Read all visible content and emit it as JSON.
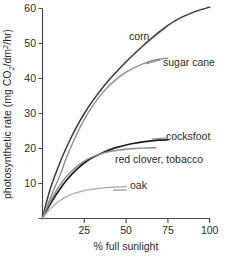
{
  "chart_data": {
    "type": "line",
    "title": "",
    "xlabel": "% full sunlight",
    "ylabel": "photosynthetic rate (mg CO2/dm2/hr)",
    "ylabel_parts": {
      "before": "photosynthetic rate (mg CO",
      "sub1": "2",
      "mid": "/dm",
      "sup1": "2",
      "after": "/hr)"
    },
    "xlim": [
      0,
      100
    ],
    "ylim": [
      0,
      60
    ],
    "xticks": [
      25,
      50,
      75,
      100
    ],
    "xtick_labels": [
      "25",
      "50",
      "75",
      "100"
    ],
    "yticks": [
      10,
      20,
      30,
      40,
      50,
      60
    ],
    "ytick_labels": [
      "10",
      "20",
      "30",
      "40",
      "50",
      "60"
    ],
    "grid": false,
    "legend_position": "inline-annotations",
    "series": [
      {
        "name": "corn",
        "label": "corn",
        "color": "#3a3a3a",
        "width": 1.5,
        "points": [
          [
            0,
            0
          ],
          [
            2,
            4.0
          ],
          [
            5,
            9.0
          ],
          [
            8,
            13.0
          ],
          [
            12,
            17.8
          ],
          [
            16,
            22.0
          ],
          [
            20,
            25.8
          ],
          [
            25,
            30.0
          ],
          [
            30,
            33.6
          ],
          [
            35,
            36.8
          ],
          [
            40,
            39.7
          ],
          [
            45,
            42.3
          ],
          [
            50,
            44.8
          ],
          [
            55,
            47.1
          ],
          [
            60,
            49.3
          ],
          [
            65,
            51.4
          ],
          [
            70,
            53.4
          ],
          [
            75,
            55.2
          ],
          [
            80,
            56.7
          ],
          [
            85,
            57.9
          ],
          [
            90,
            58.9
          ],
          [
            95,
            59.7
          ],
          [
            100,
            60.4
          ]
        ]
      },
      {
        "name": "sugar-cane",
        "label": "sugar cane",
        "color": "#8f8f8f",
        "width": 1.4,
        "points": [
          [
            0,
            0
          ],
          [
            2,
            2.6
          ],
          [
            5,
            6.2
          ],
          [
            8,
            9.6
          ],
          [
            11,
            13.0
          ],
          [
            14,
            17.0
          ],
          [
            18,
            21.5
          ],
          [
            22,
            25.6
          ],
          [
            26,
            29.2
          ],
          [
            30,
            32.2
          ],
          [
            35,
            35.4
          ],
          [
            40,
            38.0
          ],
          [
            45,
            40.1
          ],
          [
            50,
            41.8
          ],
          [
            55,
            43.1
          ],
          [
            60,
            44.2
          ],
          [
            65,
            45.0
          ],
          [
            70,
            45.5
          ],
          [
            75,
            45.8
          ]
        ]
      },
      {
        "name": "cocksfoot",
        "label": "cocksfoot",
        "color": "#1e1e1e",
        "width": 1.7,
        "points": [
          [
            0,
            0
          ],
          [
            2,
            1.9
          ],
          [
            5,
            4.4
          ],
          [
            8,
            6.7
          ],
          [
            11,
            8.8
          ],
          [
            14,
            10.7
          ],
          [
            18,
            12.9
          ],
          [
            22,
            14.7
          ],
          [
            26,
            16.2
          ],
          [
            30,
            17.4
          ],
          [
            35,
            18.6
          ],
          [
            40,
            19.6
          ],
          [
            45,
            20.4
          ],
          [
            50,
            21.0
          ],
          [
            55,
            21.5
          ],
          [
            60,
            21.9
          ],
          [
            65,
            22.2
          ],
          [
            70,
            22.4
          ],
          [
            75,
            22.5
          ]
        ]
      },
      {
        "name": "red-clover-tobacco",
        "label": "red clover, tobacco",
        "color": "#8a8a8a",
        "width": 1.4,
        "points": [
          [
            0,
            0
          ],
          [
            2,
            2.3
          ],
          [
            5,
            5.2
          ],
          [
            8,
            7.7
          ],
          [
            11,
            9.9
          ],
          [
            14,
            11.8
          ],
          [
            18,
            13.8
          ],
          [
            22,
            15.4
          ],
          [
            26,
            16.7
          ],
          [
            30,
            17.6
          ],
          [
            35,
            18.5
          ],
          [
            40,
            19.1
          ],
          [
            45,
            19.5
          ],
          [
            50,
            19.8
          ],
          [
            55,
            20.0
          ],
          [
            60,
            20.1
          ],
          [
            65,
            20.2
          ],
          [
            68,
            20.2
          ]
        ]
      },
      {
        "name": "oak",
        "label": "oak",
        "color": "#a9a9a9",
        "width": 1.3,
        "points": [
          [
            0,
            0
          ],
          [
            2,
            1.3
          ],
          [
            5,
            2.9
          ],
          [
            8,
            4.2
          ],
          [
            11,
            5.3
          ],
          [
            14,
            6.2
          ],
          [
            18,
            7.0
          ],
          [
            22,
            7.6
          ],
          [
            26,
            8.1
          ],
          [
            30,
            8.4
          ],
          [
            35,
            8.7
          ],
          [
            40,
            8.9
          ],
          [
            45,
            9.0
          ],
          [
            50,
            9.1
          ]
        ]
      }
    ],
    "annotations": [
      {
        "name": "corn",
        "text": "corn",
        "x": 129,
        "y": 40
      },
      {
        "name": "sugar-cane",
        "text": "sugar cane",
        "x": 163,
        "y": 66
      },
      {
        "name": "cocksfoot",
        "text": "cocksfoot",
        "x": 166,
        "y": 140
      },
      {
        "name": "red-clover-tobacco",
        "text": "red clover, tobacco",
        "x": 115,
        "y": 163
      },
      {
        "name": "oak",
        "text": "oak",
        "x": 130,
        "y": 189
      }
    ]
  }
}
